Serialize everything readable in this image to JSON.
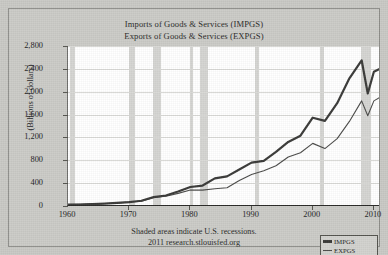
{
  "figure": {
    "titles": {
      "imports": "Imports of Goods & Services (IMPGS)",
      "exports": "Exports of Goods & Services (EXPGS)"
    },
    "footer": {
      "recessions_note": "Shaded areas indicate U.S. recessions.",
      "source": "2011 research.stlouisfed.org"
    },
    "legend": {
      "items": [
        {
          "key": "imports",
          "label": "IMPGS",
          "color": "#3a3a38"
        },
        {
          "key": "exports",
          "label": "EXPGS",
          "color": "#4a4a48"
        }
      ]
    }
  },
  "chart_data": {
    "type": "line",
    "subtitle": "Shaded areas indicate U.S. recessions.",
    "xlabel": "",
    "ylabel": "(Billions of dollars)",
    "xlim": [
      1960,
      2011
    ],
    "ylim": [
      0,
      2800
    ],
    "yticks": [
      0,
      400,
      800,
      1200,
      1600,
      2000,
      2400,
      2800
    ],
    "ytick_labels": [
      "0",
      "400",
      "800",
      "1,200",
      "1,600",
      "2,000",
      "2,400",
      "2,800"
    ],
    "xticks": [
      1960,
      1970,
      1980,
      1990,
      2000,
      2010
    ],
    "xtick_labels": [
      "1960",
      "1970",
      "1980",
      "1990",
      "2000",
      "2010"
    ],
    "grid": true,
    "grid_axis": "y",
    "legend_position": "bottom-right",
    "x": [
      1960,
      1962,
      1964,
      1966,
      1968,
      1970,
      1972,
      1974,
      1976,
      1978,
      1980,
      1982,
      1984,
      1986,
      1988,
      1990,
      1992,
      1994,
      1996,
      1998,
      2000,
      2002,
      2004,
      2006,
      2008,
      2009,
      2010,
      2011
    ],
    "series": [
      {
        "name": "IMPGS",
        "label": "Imports of Goods & Services",
        "color": "#3a3a38",
        "width": 2.2,
        "values": [
          23,
          25,
          32,
          42,
          56,
          68,
          92,
          155,
          184,
          254,
          333,
          358,
          484,
          519,
          638,
          759,
          790,
          946,
          1121,
          1230,
          1545,
          1490,
          1800,
          2235,
          2550,
          1970,
          2350,
          2400
        ]
      },
      {
        "name": "EXPGS",
        "label": "Exports of Goods & Services",
        "color": "#4a4a48",
        "width": 1.1,
        "values": [
          27,
          30,
          37,
          44,
          51,
          69,
          82,
          148,
          172,
          221,
          281,
          277,
          303,
          320,
          445,
          552,
          617,
          705,
          857,
          933,
          1096,
          1005,
          1180,
          1480,
          1840,
          1580,
          1840,
          1900
        ]
      }
    ],
    "recessions": [
      {
        "start": 1960.3,
        "end": 1961.1
      },
      {
        "start": 1969.9,
        "end": 1970.9
      },
      {
        "start": 1973.9,
        "end": 1975.2
      },
      {
        "start": 1980.0,
        "end": 1980.5
      },
      {
        "start": 1981.5,
        "end": 1982.9
      },
      {
        "start": 1990.5,
        "end": 1991.2
      },
      {
        "start": 2001.2,
        "end": 2001.9
      },
      {
        "start": 2007.9,
        "end": 2009.5
      }
    ]
  }
}
